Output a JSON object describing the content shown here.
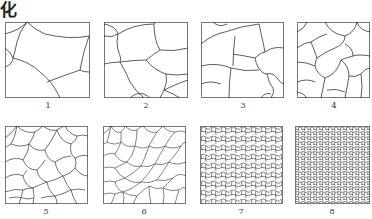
{
  "figure": {
    "title_fragment": "化",
    "panels": [
      {
        "id": 1,
        "label": "1",
        "description": "very coarse grains"
      },
      {
        "id": 2,
        "label": "2",
        "description": "coarse grains"
      },
      {
        "id": 3,
        "label": "3",
        "description": "medium-coarse grains"
      },
      {
        "id": 4,
        "label": "4",
        "description": "medium grains"
      },
      {
        "id": 5,
        "label": "5",
        "description": "medium-fine grains"
      },
      {
        "id": 6,
        "label": "6",
        "description": "fine grains"
      },
      {
        "id": 7,
        "label": "7",
        "description": "very fine grains"
      },
      {
        "id": 8,
        "label": "8",
        "description": "finest grains"
      }
    ],
    "colors": {
      "border": "#777777",
      "boundary": "#333333",
      "background": "#ffffff"
    }
  }
}
